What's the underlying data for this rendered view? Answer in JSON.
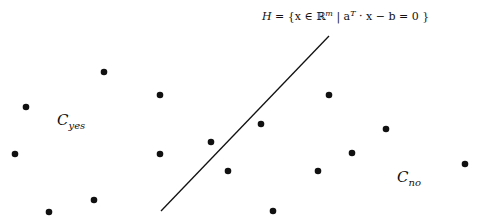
{
  "diagram": {
    "hyperplane_label": {
      "H": "H",
      "eq": " = {x ∈ ℝ",
      "sup_m": "m",
      "mid": " | a",
      "sup_T": "T",
      "rest": " · x − b = 0 }"
    },
    "class_yes": {
      "C": "C",
      "sub": "yes"
    },
    "class_no": {
      "C": "C",
      "sub": "no"
    },
    "line": {
      "x1": 161,
      "y1": 211,
      "x2": 329,
      "y2": 36,
      "color": "#111111"
    },
    "point_color": "#111111",
    "points": [
      {
        "x": 104,
        "y": 72
      },
      {
        "x": 160,
        "y": 95
      },
      {
        "x": 26,
        "y": 107
      },
      {
        "x": 15,
        "y": 154
      },
      {
        "x": 160,
        "y": 154
      },
      {
        "x": 211,
        "y": 142
      },
      {
        "x": 228,
        "y": 171
      },
      {
        "x": 94,
        "y": 200
      },
      {
        "x": 49,
        "y": 212
      },
      {
        "x": 329,
        "y": 95
      },
      {
        "x": 261,
        "y": 124
      },
      {
        "x": 386,
        "y": 129
      },
      {
        "x": 352,
        "y": 153
      },
      {
        "x": 318,
        "y": 171
      },
      {
        "x": 465,
        "y": 164
      },
      {
        "x": 273,
        "y": 211
      }
    ]
  }
}
